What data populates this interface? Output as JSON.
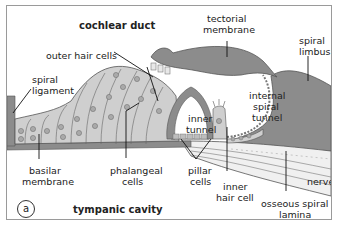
{
  "figure": {
    "panel_letter": "a",
    "colors": {
      "membrane": "#8c8c8c",
      "cells": "#cfcfcf",
      "nuclei": "#a9a9a9",
      "outline": "#555555",
      "background": "#ffffff",
      "nerve": "#e8e8e8"
    },
    "labels": {
      "cochlear_duct": "cochlear duct",
      "tectorial_membrane_1": "tectorial",
      "tectorial_membrane_2": "membrane",
      "outer_hair_cells": "outer hair cells",
      "spiral_limbus_1": "spiral",
      "spiral_limbus_2": "limbus",
      "spiral_ligament_1": "spiral",
      "spiral_ligament_2": "ligament",
      "internal_spiral_tunnel_1": "internal",
      "internal_spiral_tunnel_2": "spiral",
      "internal_spiral_tunnel_3": "tunnel",
      "inner_tunnel_1": "inner",
      "inner_tunnel_2": "tunnel",
      "basilar_membrane_1": "basilar",
      "basilar_membrane_2": "membrane",
      "phalangeal_cells_1": "phalangeal",
      "phalangeal_cells_2": "cells",
      "pillar_cells_1": "pillar",
      "pillar_cells_2": "cells",
      "inner_hair_cell_1": "inner",
      "inner_hair_cell_2": "hair cell",
      "nerve": "nerve",
      "osseous_spiral_lamina_1": "osseous spiral",
      "osseous_spiral_lamina_2": "lamina",
      "tympanic_cavity": "tympanic cavity"
    }
  }
}
